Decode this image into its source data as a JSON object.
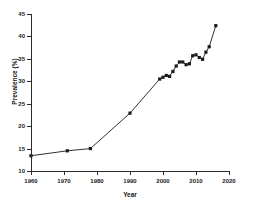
{
  "chart_data": {
    "type": "line",
    "title": "",
    "xlabel": "Year",
    "ylabel": "Prevalence (%)",
    "xlim": [
      1960,
      2020
    ],
    "ylim": [
      10,
      45
    ],
    "xticks": [
      1960,
      1970,
      1980,
      1990,
      2000,
      2010,
      2020
    ],
    "yticks": [
      10,
      15,
      20,
      25,
      30,
      35,
      40,
      45
    ],
    "xtick_labels": [
      "1960",
      "1970",
      "1980",
      "1990",
      "2000",
      "2010",
      "2020"
    ],
    "ytick_labels": [
      "10",
      "15",
      "20",
      "25",
      "30",
      "35",
      "40",
      "45"
    ],
    "grid": false,
    "legend": "none",
    "marker": "filled-square",
    "line_color": "#1a1a1a",
    "marker_color": "#1a1a1a",
    "series": [
      {
        "name": "Prevalence",
        "x": [
          1960,
          1971,
          1978,
          1990,
          1999,
          2000,
          2001,
          2002,
          2003,
          2004,
          2005,
          2006,
          2007,
          2008,
          2009,
          2010,
          2011,
          2012,
          2013,
          2014,
          2016
        ],
        "values": [
          13.4,
          14.5,
          15.0,
          22.9,
          30.5,
          30.9,
          31.3,
          31.1,
          32.2,
          33.4,
          34.3,
          34.3,
          33.7,
          33.9,
          35.7,
          35.9,
          35.3,
          34.9,
          36.5,
          37.7,
          42.4
        ]
      }
    ]
  }
}
